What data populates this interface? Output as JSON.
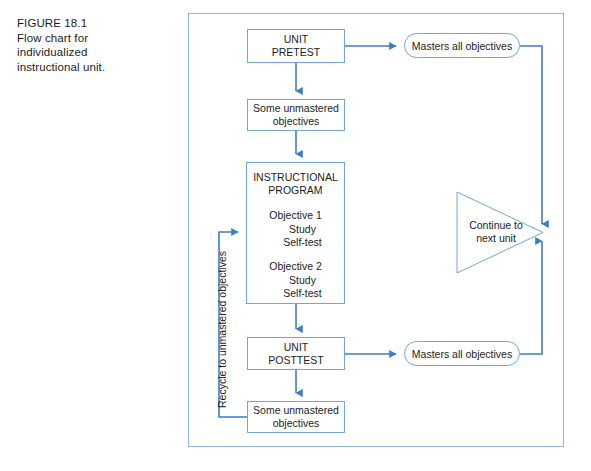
{
  "caption": {
    "lines": [
      "FIGURE 18.1",
      "Flow chart for",
      "individualized",
      "instructional unit."
    ]
  },
  "colors": {
    "frame_border": "#8fb8d8",
    "box_border": "#6fa8d4",
    "connector": "#3a7fc4",
    "text": "#1c1c1c",
    "background": "#ffffff"
  },
  "flowchart": {
    "nodes": {
      "pretest": {
        "shape": "rectangle",
        "lines": [
          "UNIT",
          "PRETEST"
        ]
      },
      "unmastered_top": {
        "shape": "rectangle",
        "lines": [
          "Some unmastered",
          "objectives"
        ]
      },
      "program": {
        "shape": "rectangle",
        "title": [
          "INSTRUCTIONAL",
          "PROGRAM"
        ],
        "objective_1": {
          "label": "Objective 1",
          "steps": [
            "Study",
            "Self-test"
          ]
        },
        "objective_2": {
          "label": "Objective 2",
          "steps": [
            "Study",
            "Self-test"
          ]
        }
      },
      "posttest": {
        "shape": "rectangle",
        "lines": [
          "UNIT",
          "POSTTEST"
        ]
      },
      "unmastered_bottom": {
        "shape": "rectangle",
        "lines": [
          "Some unmastered",
          "objectives"
        ]
      },
      "masters_top": {
        "shape": "stadium",
        "label": "Masters all objectives"
      },
      "masters_bottom": {
        "shape": "stadium",
        "label": "Masters all objectives"
      },
      "continue": {
        "shape": "triangle",
        "lines": [
          "Continue to",
          "next unit"
        ]
      }
    },
    "edges": {
      "recycle_label": "Recycle to unmastered objectives"
    }
  }
}
